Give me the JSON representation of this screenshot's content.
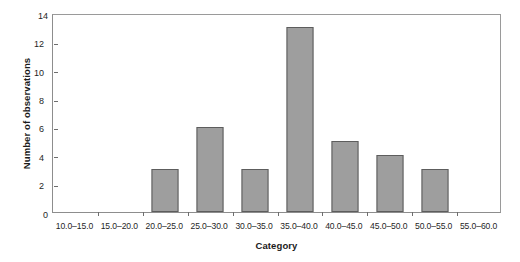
{
  "chart_data": {
    "type": "bar",
    "title": "",
    "xlabel": "Category",
    "ylabel": "Number of observations",
    "categories": [
      "10.0–15.0",
      "15.0–20.0",
      "20.0–25.0",
      "25.0–30.0",
      "30.0–35.0",
      "35.0–40.0",
      "40.0–45.0",
      "45.0–50.0",
      "50.0–55.0",
      "55.0–60.0"
    ],
    "values": [
      0,
      0,
      3,
      6,
      3,
      13,
      5,
      4,
      3,
      0
    ],
    "ylim": [
      0,
      14
    ],
    "ytick_labels": [
      "0",
      "2",
      "4",
      "6",
      "8",
      "10",
      "12",
      "14"
    ],
    "ytick_values": [
      0,
      2,
      4,
      6,
      8,
      10,
      12,
      14
    ],
    "grid": false,
    "legend": false,
    "bar_fill_color": "#9e9e9e",
    "bar_border_color": "#5d5d5d",
    "axis_color": "#8d8d8d",
    "text_color": "#1f1f1f"
  }
}
